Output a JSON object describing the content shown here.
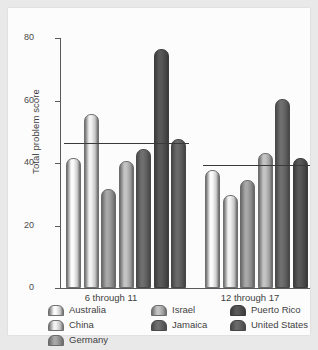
{
  "chart_data": {
    "type": "bar",
    "title": "",
    "xlabel": "",
    "ylabel": "Total problem score",
    "ylim": [
      0,
      80
    ],
    "yticks": [
      0,
      20,
      40,
      60,
      80
    ],
    "ytick_labels": [
      "0",
      "20",
      "40",
      "60",
      "80"
    ],
    "grid": false,
    "legend_position": "bottom",
    "categories": [
      "6 through 11",
      "12 through 17"
    ],
    "series": [
      {
        "name": "Australia",
        "color": "#fbfbfb",
        "edge": "#6f6f6f",
        "values": [
          41,
          37
        ]
      },
      {
        "name": "China",
        "color": "#f2f2f2",
        "edge": "#707070",
        "values": [
          55,
          29
        ]
      },
      {
        "name": "Germany",
        "color": "#a8a8a8",
        "edge": "#6a6a6a",
        "values": [
          31,
          34
        ]
      },
      {
        "name": "Israel",
        "color": "#c4c4c4",
        "edge": "#6c6c6c",
        "values": [
          40,
          42.5
        ]
      },
      {
        "name": "Jamaica",
        "color": "#6f6f6f",
        "edge": "#4a4a4a",
        "values": [
          44,
          60
        ]
      },
      {
        "name": "Puerto Rico",
        "color": "#595959",
        "edge": "#3d3d3d",
        "values": [
          76,
          41
        ]
      },
      {
        "name": "United States",
        "color": "#6a6a6a",
        "edge": "#474747",
        "values": [
          47,
          0
        ]
      }
    ],
    "reference_lines": [
      {
        "group": "6 through 11",
        "value": 46
      },
      {
        "group": "12 through 17",
        "value": 39
      }
    ],
    "annotations": []
  },
  "legend": {
    "columns": [
      {
        "items": [
          "Australia",
          "China",
          "Germany"
        ]
      },
      {
        "items": [
          "Israel",
          "Jamaica"
        ]
      },
      {
        "items": [
          "Puerto Rico",
          "United States"
        ]
      }
    ]
  },
  "colors": {
    "background": "#e9e9e9",
    "card": "#fcfcfc",
    "axis": "#5a5a5a",
    "text": "#3f3f3f",
    "reference_line": "#3a3a3a"
  }
}
